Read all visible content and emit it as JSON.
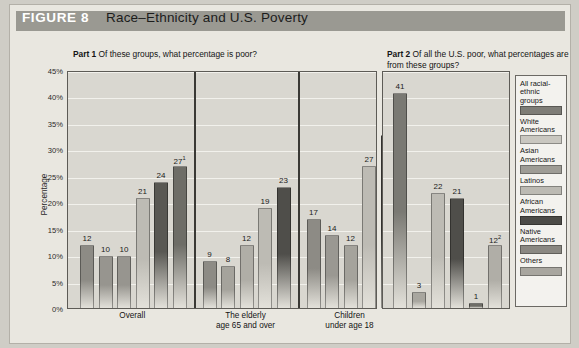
{
  "header": {
    "figure_label": "FIGURE 8",
    "title": "Race–Ethnicity and U.S. Poverty",
    "band_color": "#9a9992"
  },
  "part1": {
    "caption_bold": "Part 1",
    "caption_text": "Of these groups, what percentage is poor?"
  },
  "part2": {
    "caption_bold": "Part 2",
    "caption_text": "Of all the U.S. poor, what percentages are from these groups?"
  },
  "axis": {
    "ylabel": "Percentage",
    "ticks": [
      "45%",
      "40%",
      "35%",
      "30%",
      "25%",
      "20%",
      "15%",
      "10%",
      "5%",
      "0%"
    ],
    "ymin": 0,
    "ymax": 45
  },
  "legend": {
    "items": [
      {
        "label": "All racial-ethnic groups",
        "color": "#7e7d77"
      },
      {
        "label": "White Americans",
        "color": "#c9c7c0"
      },
      {
        "label": "Asian Americans",
        "color": "#9e9c95"
      },
      {
        "label": "Latinos",
        "color": "#bcbab3"
      },
      {
        "label": "African Americans",
        "color": "#4c4b47"
      },
      {
        "label": "Native Americans",
        "color": "#8a8882"
      },
      {
        "label": "Others",
        "color": "#a8a69f"
      }
    ]
  },
  "chart_data": {
    "type": "bar",
    "title": "Race–Ethnicity and U.S. Poverty",
    "ylabel": "Percentage",
    "xlabel": "",
    "ylim": [
      0,
      45
    ],
    "grid": true,
    "legend_position": "right",
    "panels": [
      {
        "name": "Part 1",
        "subtitle": "Of these groups, what percentage is poor?",
        "groups": [
          {
            "label": "Overall",
            "label_line2": "",
            "bars": [
              {
                "series": "All racial-ethnic groups",
                "value": 12,
                "label": "12",
                "color": "#8d8b85"
              },
              {
                "series": "White Americans",
                "value": 10,
                "label": "10",
                "color": "#97958f"
              },
              {
                "series": "Asian Americans",
                "value": 10,
                "label": "10",
                "color": "#97958f"
              },
              {
                "series": "Latinos",
                "value": 21,
                "label": "21",
                "color": "#bdbbb4"
              },
              {
                "series": "African Americans",
                "value": 24,
                "label": "24",
                "color": "#595853"
              },
              {
                "series": "Native Americans",
                "value": 27,
                "label": "27",
                "superscript": "1",
                "color": "#6e6d67"
              }
            ]
          },
          {
            "label": "The elderly",
            "label_line2": "age 65 and over",
            "bars": [
              {
                "series": "All racial-ethnic groups",
                "value": 9,
                "label": "9",
                "color": "#8d8b85"
              },
              {
                "series": "White Americans",
                "value": 8,
                "label": "8",
                "color": "#a5a39c"
              },
              {
                "series": "Asian Americans",
                "value": 12,
                "label": "12",
                "color": "#b0aea7"
              },
              {
                "series": "Latinos",
                "value": 19,
                "label": "19",
                "color": "#bdbbb4"
              },
              {
                "series": "African Americans",
                "value": 23,
                "label": "23",
                "color": "#4f4e4a"
              }
            ]
          },
          {
            "label": "Children",
            "label_line2": "under age 18",
            "bars": [
              {
                "series": "All racial-ethnic groups",
                "value": 17,
                "label": "17",
                "color": "#8d8b85"
              },
              {
                "series": "White Americans",
                "value": 14,
                "label": "14",
                "color": "#9a9892"
              },
              {
                "series": "Asian Americans",
                "value": 12,
                "label": "12",
                "color": "#a5a39c"
              },
              {
                "series": "Latinos",
                "value": 27,
                "label": "27",
                "color": "#bdbbb4"
              },
              {
                "series": "African Americans",
                "value": 33,
                "label": "33",
                "color": "#4f4e4a"
              }
            ]
          }
        ]
      },
      {
        "name": "Part 2",
        "subtitle": "Of all the U.S. poor, what percentages are from these groups?",
        "groups": [
          {
            "label": "",
            "label_line2": "",
            "bars": [
              {
                "series": "White Americans",
                "value": 41,
                "label": "41",
                "color": "#7a7973"
              },
              {
                "series": "Asian Americans",
                "value": 3,
                "label": "3",
                "color": "#a8a69f"
              },
              {
                "series": "Latinos",
                "value": 22,
                "label": "22",
                "color": "#bdbbb4"
              },
              {
                "series": "African Americans",
                "value": 21,
                "label": "21",
                "color": "#4f4e4a"
              },
              {
                "series": "Native Americans",
                "value": 1,
                "label": "1",
                "color": "#6e6d67"
              },
              {
                "series": "Others",
                "value": 12,
                "label": "12",
                "superscript": "2",
                "color": "#b0aea7"
              }
            ]
          }
        ]
      }
    ]
  }
}
